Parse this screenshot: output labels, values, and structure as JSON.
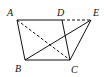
{
  "diagram": {
    "type": "geometry",
    "points": {
      "A": {
        "label": "A",
        "x": 17,
        "y": 20
      },
      "D": {
        "label": "D",
        "x": 62,
        "y": 20
      },
      "E": {
        "label": "E",
        "x": 91,
        "y": 20
      },
      "B": {
        "label": "B",
        "x": 25,
        "y": 60
      },
      "C": {
        "label": "C",
        "x": 70,
        "y": 60
      }
    },
    "segments": [
      {
        "from": "A",
        "to": "D",
        "style": "solid"
      },
      {
        "from": "D",
        "to": "E",
        "style": "dashed"
      },
      {
        "from": "A",
        "to": "B",
        "style": "solid"
      },
      {
        "from": "B",
        "to": "C",
        "style": "solid"
      },
      {
        "from": "D",
        "to": "C",
        "style": "solid"
      },
      {
        "from": "C",
        "to": "E",
        "style": "solid"
      },
      {
        "from": "B",
        "to": "E",
        "style": "solid"
      },
      {
        "from": "A",
        "to": "C",
        "style": "dashed"
      }
    ],
    "line_color": "#111111"
  }
}
